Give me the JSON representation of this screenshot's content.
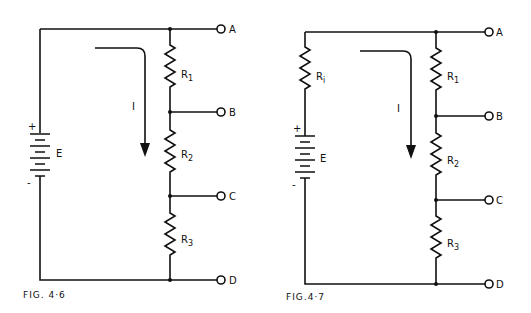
{
  "figures": [
    {
      "caption": "FIG. 4·6",
      "source_label": "E",
      "plus": "+",
      "minus": "-",
      "current_label": "I",
      "resistors": [
        "R1",
        "R2",
        "R3"
      ],
      "resistor_labels": [
        {
          "base": "R",
          "sub": "1"
        },
        {
          "base": "R",
          "sub": "2"
        },
        {
          "base": "R",
          "sub": "3"
        }
      ],
      "terminals": [
        "A",
        "B",
        "C",
        "D"
      ]
    },
    {
      "caption": "FIG.4·7",
      "source_label": "E",
      "internal_resistor": {
        "base": "R",
        "sub": "i"
      },
      "plus": "+",
      "minus": "-",
      "current_label": "I",
      "resistors": [
        "R1",
        "R2",
        "R3"
      ],
      "resistor_labels": [
        {
          "base": "R",
          "sub": "1"
        },
        {
          "base": "R",
          "sub": "2"
        },
        {
          "base": "R",
          "sub": "3"
        }
      ],
      "terminals": [
        "A",
        "B",
        "C",
        "D"
      ]
    }
  ]
}
